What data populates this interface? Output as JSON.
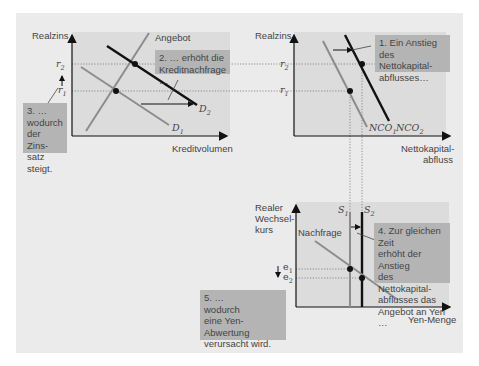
{
  "panel_loanable_funds": {
    "y_axis": "Realzins",
    "x_axis": "Kreditvolumen",
    "supply_label": "Angebot",
    "demand1": "D",
    "demand1_sub": "1",
    "demand2": "D",
    "demand2_sub": "2",
    "r1": "r",
    "r1_sub": "1",
    "r2": "r",
    "r2_sub": "2",
    "callout2": "2. … erhöht die Kreditnachfrage …",
    "callout3_line1": "3. …",
    "callout3_line2": "wodurch",
    "callout3_line3": "der Zins-",
    "callout3_line4": "satz steigt."
  },
  "panel_net_capital_outflow": {
    "y_axis": "Realzins",
    "x_axis_line1": "Nettokapital-",
    "x_axis_line2": "abfluss",
    "r1": "r",
    "r1_sub": "1",
    "r2": "r",
    "r2_sub": "2",
    "nco1": "NCO",
    "nco1_sub": "1",
    "nco2": "NCO",
    "nco2_sub": "2",
    "callout1_line1": "1. Ein Anstieg des",
    "callout1_line2": "Nettokapital-",
    "callout1_line3": "abflusses…"
  },
  "panel_foreign_exchange": {
    "y_axis_line1": "Realer",
    "y_axis_line2": "Wechsel-",
    "y_axis_line3": "kurs",
    "x_axis": "Yen-Menge",
    "demand_label": "Nachfrage",
    "s1": "S",
    "s1_sub": "1",
    "s2": "S",
    "s2_sub": "2",
    "e1": "e",
    "e1_sub": "1",
    "e2": "e",
    "e2_sub": "2",
    "callout4_line1": "4. Zur gleichen Zeit",
    "callout4_line2": "erhöht der Anstieg",
    "callout4_line3": "des Nettokapital-",
    "callout4_line4": "abflusses das",
    "callout4_line5": "Angebot an Yen …",
    "callout5_line1": "5. …",
    "callout5_line2": "wodurch",
    "callout5_line3": "eine Yen-Abwertung",
    "callout5_line4": "verursacht wird."
  },
  "colors": {
    "panel_bg": "#ebebeb",
    "plot_bg": "#dcdcdc",
    "callout_bg": "#b4b4b4",
    "curve_old": "#8c8c8c",
    "curve_new": "#111111"
  }
}
